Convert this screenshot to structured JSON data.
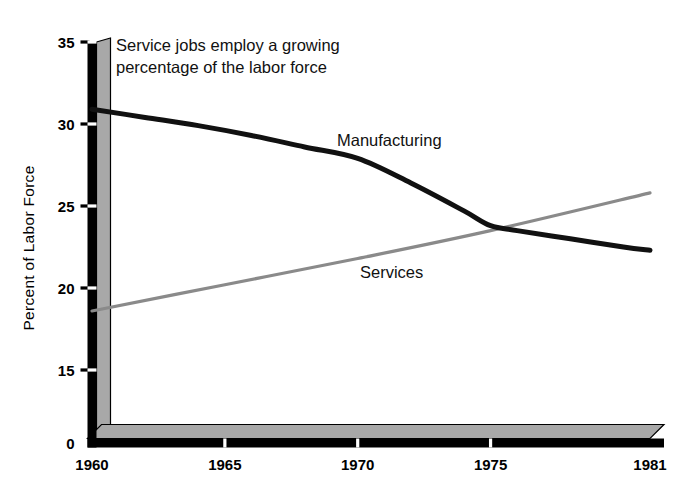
{
  "chart_data": {
    "type": "line",
    "title": "",
    "annotation": "Service jobs employ a growing percentage of the labor force",
    "annotation_line1": "Service jobs employ a growing",
    "annotation_line2": "percentage of the labor force",
    "xlabel": "",
    "ylabel": "Percent of Labor Force",
    "x_tick_labels": [
      "1960",
      "1965",
      "1970",
      "1975",
      "1981"
    ],
    "x_tick_values": [
      1960,
      1965,
      1970,
      1975,
      1981
    ],
    "y_tick_labels": [
      "0",
      "15",
      "20",
      "25",
      "30",
      "35"
    ],
    "y_tick_values": [
      0,
      15,
      20,
      25,
      30,
      35
    ],
    "xlim": [
      1960,
      1981
    ],
    "ylim": [
      15,
      35
    ],
    "axis_break": true,
    "grid": false,
    "legend_position": "inline-labels",
    "series": [
      {
        "name": "Manufacturing",
        "color": "#111111",
        "label_text": "Manufacturing",
        "x": [
          1960,
          1962,
          1964,
          1966,
          1968,
          1970,
          1972,
          1974,
          1975,
          1976,
          1978,
          1980,
          1981
        ],
        "values": [
          30.9,
          30.4,
          29.9,
          29.3,
          28.6,
          27.9,
          26.4,
          24.7,
          23.8,
          23.5,
          23.0,
          22.5,
          22.3
        ]
      },
      {
        "name": "Services",
        "color": "#8a8a8a",
        "label_text": "Services",
        "x": [
          1960,
          1965,
          1970,
          1975,
          1981
        ],
        "values": [
          18.6,
          20.2,
          21.8,
          23.5,
          25.8
        ]
      }
    ]
  },
  "figure": {
    "background_color": "#ffffff",
    "axis_color": "#000000",
    "axis_shadow_color": "#a8a8a8",
    "manufacturing_color": "#111111",
    "services_color": "#8a8a8a"
  }
}
